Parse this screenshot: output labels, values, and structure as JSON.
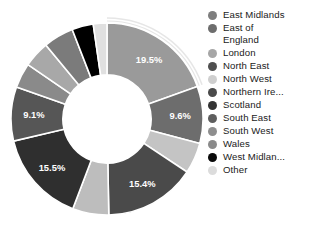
{
  "chart_data": {
    "type": "pie",
    "variant": "donut",
    "title": "",
    "subtitle": "",
    "xlabel": "",
    "ylabel": "",
    "grid": false,
    "legend_position": "right",
    "hole_ratio": 0.46,
    "start_angle_deg": -90,
    "direction": "clockwise",
    "highlighted_category": "East Midlands",
    "categories": [
      "East Midlands",
      "East of England",
      "London",
      "North East",
      "North West",
      "Northern Ire...",
      "Scotland",
      "South East",
      "South West",
      "Wales",
      "West Midlan...",
      "Other"
    ],
    "values": [
      19.5,
      9.6,
      5.2,
      15.4,
      6.1,
      15.5,
      9.1,
      4.2,
      4.4,
      5.1,
      3.6,
      2.3
    ],
    "value_unit": "%",
    "colors": [
      "#9a9a9a",
      "#6d6d6d",
      "#c4c4c4",
      "#4a4a4a",
      "#bdbdbd",
      "#2f2f2f",
      "#565656",
      "#8a8a8a",
      "#a8a8a8",
      "#7b7b7b",
      "#000000",
      "#e0e0e0"
    ],
    "data_labels": [
      {
        "category": "East Midlands",
        "text": "19.5%",
        "shown": true
      },
      {
        "category": "East of England",
        "text": "9.6%",
        "shown": true
      },
      {
        "category": "London",
        "text": "",
        "shown": false
      },
      {
        "category": "North East",
        "text": "15.4%",
        "shown": true
      },
      {
        "category": "North West",
        "text": "",
        "shown": false
      },
      {
        "category": "Northern Ire...",
        "text": "15.5%",
        "shown": true
      },
      {
        "category": "Scotland",
        "text": "9.1%",
        "shown": true
      },
      {
        "category": "South East",
        "text": "",
        "shown": false
      },
      {
        "category": "South West",
        "text": "",
        "shown": false
      },
      {
        "category": "Wales",
        "text": "",
        "shown": false
      },
      {
        "category": "West Midlan...",
        "text": "",
        "shown": false
      },
      {
        "category": "Other",
        "text": "",
        "shown": false
      }
    ],
    "annotations": []
  },
  "labels": {
    "east_midlands": "19.5%",
    "east_of_england": "9.6%",
    "north_east": "15.4%",
    "northern_ireland": "15.5%",
    "scotland": "9.1%"
  },
  "legend": {
    "items": [
      {
        "label": "East Midlands",
        "color": "#7e7e7e"
      },
      {
        "label": "East of\nEngland",
        "color": "#6d6d6d"
      },
      {
        "label": "London",
        "color": "#a6a6a6"
      },
      {
        "label": "North East",
        "color": "#4f4f4f"
      },
      {
        "label": "North West",
        "color": "#cfcfcf"
      },
      {
        "label": "Northern Ire...",
        "color": "#4a4a4a"
      },
      {
        "label": "Scotland",
        "color": "#333333"
      },
      {
        "label": "South East",
        "color": "#5e5e5e"
      },
      {
        "label": "South West",
        "color": "#8e8e8e"
      },
      {
        "label": "Wales",
        "color": "#8a8a8a"
      },
      {
        "label": "West Midlan...",
        "color": "#0a0a0a"
      },
      {
        "label": "Other",
        "color": "#dcdcdc"
      }
    ]
  },
  "style": {
    "background": "#ffffff",
    "separator_color": "#ffffff",
    "highlight_outline_color": "#e6e6e6",
    "label_text_color": "#ffffff",
    "legend_text_color": "#1a1a1a"
  }
}
